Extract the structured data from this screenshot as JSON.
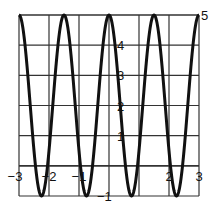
{
  "chart_data": {
    "type": "line",
    "title": "",
    "xlabel": "",
    "ylabel": "",
    "function": "y = 2 + 3cos(4πx/3)",
    "xlim": [
      -3,
      3
    ],
    "ylim": [
      -1,
      5
    ],
    "grid": true,
    "x_ticks": [
      -3,
      -2,
      -1,
      0,
      1,
      2,
      3
    ],
    "x_tick_labels": [
      "−3",
      "−2",
      "−1",
      "",
      "",
      "2",
      "3"
    ],
    "y_ticks": [
      -1,
      0,
      1,
      2,
      3,
      4,
      5
    ],
    "y_tick_labels": [
      "−1",
      "",
      "1",
      "2",
      "3",
      "4",
      "5"
    ],
    "series": [
      {
        "name": "curve",
        "amplitude": 3,
        "midline": 2,
        "period": 1.5,
        "maxima_x": [
          -3,
          -1.5,
          0,
          1.5,
          3
        ],
        "minima_x": [
          -2.25,
          -0.75,
          0.75,
          2.25
        ],
        "max_value": 5,
        "min_value": -1
      }
    ],
    "colors": {
      "curve": "#111111",
      "grid": "#333333",
      "background": "#ffffff"
    }
  }
}
